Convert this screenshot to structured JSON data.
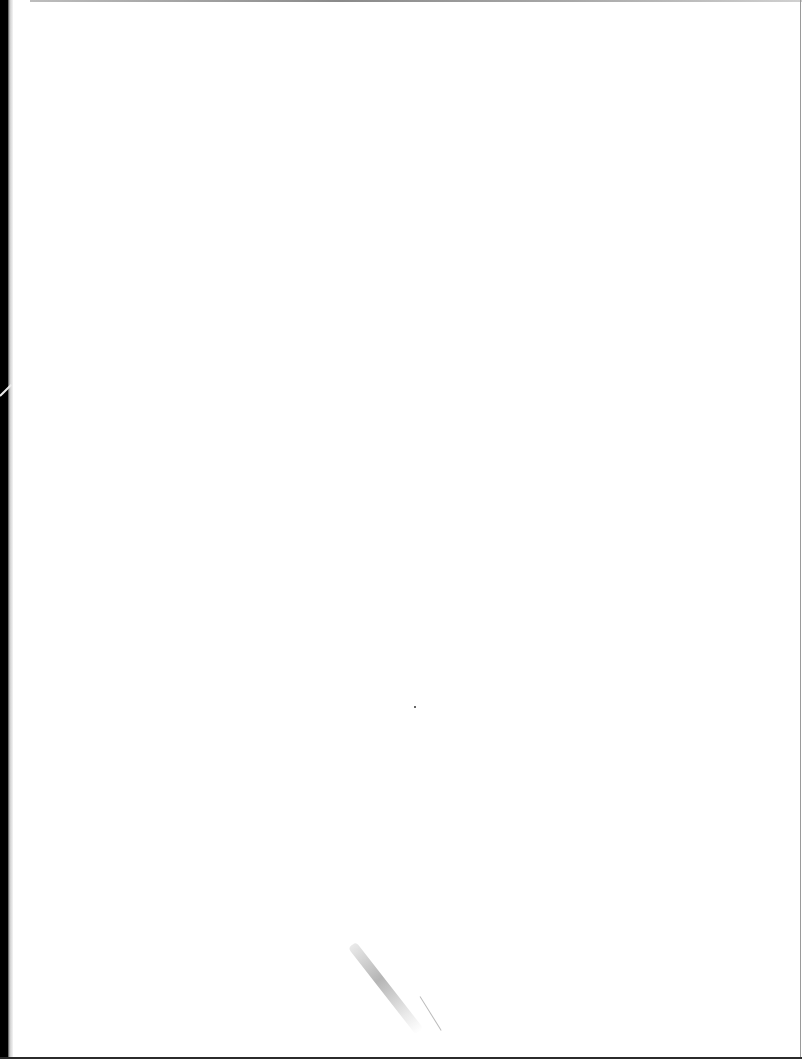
{
  "document": {
    "type": "scanned-page",
    "content": "",
    "is_blank": true
  },
  "colors": {
    "paper": "#ffffff",
    "binding_edge": "#000000",
    "border_gray": "#9a9a9a"
  }
}
